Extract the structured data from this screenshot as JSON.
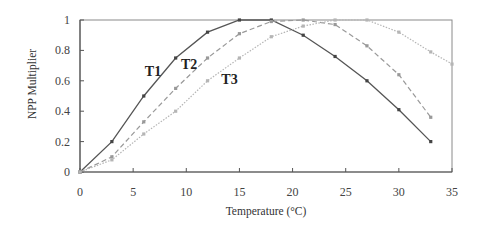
{
  "chart_data": {
    "type": "line",
    "title": "",
    "xlabel": "Temperature (°C)",
    "ylabel": "NPP Multiplier",
    "xlim": [
      0,
      35
    ],
    "ylim": [
      0,
      1
    ],
    "x_ticks": [
      "0",
      "5",
      "10",
      "15",
      "20",
      "25",
      "30",
      "35"
    ],
    "y_ticks": [
      "0",
      "0.2",
      "0.4",
      "0.6",
      "0.8",
      "1"
    ],
    "grid": false,
    "legend": "inline labels",
    "series": [
      {
        "name": "T1",
        "style": "solid",
        "color": "#555555",
        "x": [
          0,
          3,
          6,
          9,
          12,
          15,
          18,
          21,
          24,
          27,
          30,
          33
        ],
        "values": [
          0,
          0.2,
          0.5,
          0.75,
          0.92,
          1.0,
          1.0,
          0.9,
          0.76,
          0.6,
          0.41,
          0.2
        ]
      },
      {
        "name": "T2",
        "style": "dashed",
        "color": "#999999",
        "x": [
          0,
          3,
          6,
          9,
          12,
          15,
          18,
          21,
          24,
          27,
          30,
          33
        ],
        "values": [
          0,
          0.1,
          0.33,
          0.55,
          0.75,
          0.91,
          0.99,
          1.0,
          0.97,
          0.83,
          0.64,
          0.36
        ]
      },
      {
        "name": "T3",
        "style": "dotted",
        "color": "#b5b5b5",
        "x": [
          0,
          3,
          6,
          9,
          12,
          15,
          18,
          21,
          24,
          27,
          30,
          33,
          35
        ],
        "values": [
          0,
          0.08,
          0.25,
          0.4,
          0.6,
          0.75,
          0.89,
          0.96,
          1.0,
          1.0,
          0.92,
          0.79,
          0.71
        ]
      }
    ],
    "annotations": [
      {
        "text": "T1",
        "x": 6.1,
        "y": 0.63
      },
      {
        "text": "T2",
        "x": 9.5,
        "y": 0.68
      },
      {
        "text": "T3",
        "x": 13.3,
        "y": 0.58
      }
    ]
  }
}
